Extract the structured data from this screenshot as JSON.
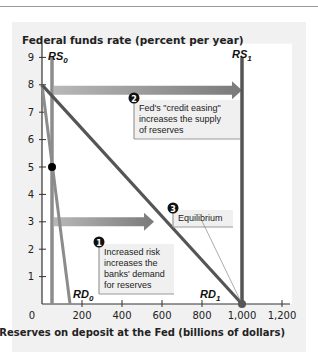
{
  "chart_data": {
    "type": "line",
    "title": "",
    "ylabel": "Federal funds rate (percent per year)",
    "xlabel": "Reserves on deposit at the Fed (billions of dollars)",
    "xlim": [
      0,
      1250
    ],
    "ylim": [
      0,
      9.5
    ],
    "x_ticks": [
      "0",
      "200",
      "400",
      "600",
      "800",
      "1,000",
      "1,200"
    ],
    "y_ticks": [
      "1",
      "2",
      "3",
      "4",
      "5",
      "6",
      "7",
      "8",
      "9"
    ],
    "grid": false,
    "series": [
      {
        "name": "RS0",
        "label": "RS",
        "sub": "0",
        "points": [
          [
            50,
            0
          ],
          [
            50,
            9
          ]
        ],
        "color": "#8c8c8c"
      },
      {
        "name": "RS1",
        "label": "RS",
        "sub": "1",
        "points": [
          [
            1000,
            0
          ],
          [
            1000,
            9
          ]
        ],
        "color": "#555555"
      },
      {
        "name": "RD0",
        "label": "RD",
        "sub": "0",
        "points": [
          [
            0,
            8
          ],
          [
            140,
            0
          ]
        ],
        "color": "#8c8c8c"
      },
      {
        "name": "RD1",
        "label": "RD",
        "sub": "1",
        "points": [
          [
            0,
            8
          ],
          [
            1000,
            0
          ]
        ],
        "color": "#555555"
      }
    ],
    "points": [
      {
        "name": "initial-equilibrium",
        "x": 50,
        "y": 5,
        "color": "#000000"
      },
      {
        "name": "new-equilibrium",
        "x": 1000,
        "y": 0,
        "color": "#555555"
      }
    ],
    "arrows": [
      {
        "name": "supply-shift-arrow",
        "from": [
          60,
          7.8
        ],
        "to": [
          1000,
          7.8
        ]
      },
      {
        "name": "demand-shift-arrow",
        "from": [
          60,
          3
        ],
        "to": [
          560,
          3
        ]
      }
    ],
    "annotations": [
      {
        "number": "1",
        "lines": [
          "Increased risk",
          "increases the",
          "banks' demand",
          "for reserves"
        ]
      },
      {
        "number": "2",
        "lines": [
          "Fed's \"credit easing\"",
          "increases the supply",
          "of reserves"
        ]
      },
      {
        "number": "3",
        "lines": [
          "Equilibrium"
        ]
      }
    ]
  },
  "colors": {
    "panel": "#f1f1f1",
    "plot_bg": "#ffffff",
    "light_curve": "#8c8c8c",
    "dark_curve": "#555555",
    "callout_bg": "#f0f0f0"
  }
}
